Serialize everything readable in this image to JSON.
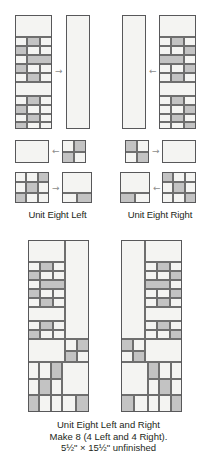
{
  "document": {
    "type": "quilting-unit-assembly-diagram",
    "title": "Unit Eight Left and Right"
  },
  "colors": {
    "light_fabric": "#f4f4f2",
    "dark_fabric": "#c3c3c3",
    "seam_line": "#6e6e6e",
    "outline": "#58585a",
    "arrow": "#8d8d8d",
    "text": "#231f20",
    "background": "#ffffff"
  },
  "labels": {
    "unit_eight_left": "Unit Eight Left",
    "unit_eight_right": "Unit Eight Right"
  },
  "caption": {
    "line1": "Unit Eight Left and Right",
    "line2": "Make 8 (4 Left and 4 Right).",
    "line3_prefix": "5",
    "line3_frac1": "1/2",
    "line3_mid": "\" × 15",
    "line3_frac2": "1/2",
    "line3_suffix": "\" unfinished",
    "line3_plain": "5½\" × 15½\" unfinished"
  },
  "arrows": {
    "top_left_join": "→",
    "top_right_join": "←",
    "mid_left_join": "←",
    "mid_right_join": "→",
    "low_left_join": "→",
    "low_right_join": "←"
  },
  "pieces": {
    "left_pieced_strip": {
      "name": "Left pieced strip",
      "rows": [
        "light",
        "nine-patch-a",
        "dark-bar",
        "nine-patch-b",
        "light",
        "nine-patch-c"
      ]
    },
    "left_plain_strip": {
      "name": "Left plain background strip",
      "fill": "light"
    },
    "right_pieced_strip": {
      "name": "Right pieced strip (mirror)",
      "rows": [
        "light",
        "nine-patch-a",
        "dark-bar",
        "nine-patch-b",
        "light",
        "nine-patch-c"
      ]
    },
    "right_plain_strip": {
      "name": "Right plain background strip",
      "fill": "light"
    },
    "left_rect": {
      "name": "Left plain rectangle",
      "fill": "light"
    },
    "left_four_patch": {
      "name": "Left four patch",
      "grid": [
        [
          "light",
          "dark"
        ],
        [
          "dark",
          "light"
        ]
      ]
    },
    "right_four_patch": {
      "name": "Right four patch",
      "grid": [
        [
          "dark",
          "light"
        ],
        [
          "light",
          "dark"
        ]
      ]
    },
    "right_rect": {
      "name": "Right plain rectangle",
      "fill": "light"
    },
    "left_nine_patch": {
      "name": "Left nine patch block",
      "grid": [
        [
          "light",
          "light",
          "dark"
        ],
        [
          "light",
          "dark",
          "light"
        ],
        [
          "dark",
          "light",
          "light"
        ]
      ]
    },
    "left_corner_block": {
      "name": "Left corner background block",
      "grid": [
        [
          "light",
          "light"
        ],
        [
          "light",
          "dark"
        ]
      ]
    },
    "right_nine_patch": {
      "name": "Right nine patch block",
      "grid": [
        [
          "dark",
          "light",
          "light"
        ],
        [
          "light",
          "dark",
          "light"
        ],
        [
          "light",
          "light",
          "dark"
        ]
      ]
    },
    "right_corner_block": {
      "name": "Right corner background block",
      "grid": [
        [
          "light",
          "light"
        ],
        [
          "dark",
          "light"
        ]
      ]
    }
  },
  "finished_units": {
    "left": {
      "name": "Unit Eight Left assembled",
      "description": "Pieced column on left, plain background column on right, four-patch and nine-patch at bottom"
    },
    "right": {
      "name": "Unit Eight Right assembled",
      "description": "Plain background column on left, pieced column on right, mirrored bottom blocks"
    }
  }
}
